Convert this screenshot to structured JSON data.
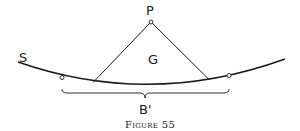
{
  "figure": {
    "caption": "Figure 55",
    "labels": {
      "S": "S",
      "P": "P",
      "G": "G",
      "B": "B'"
    },
    "colors": {
      "stroke": "#1a1a1a",
      "background": "#ffffff"
    }
  }
}
